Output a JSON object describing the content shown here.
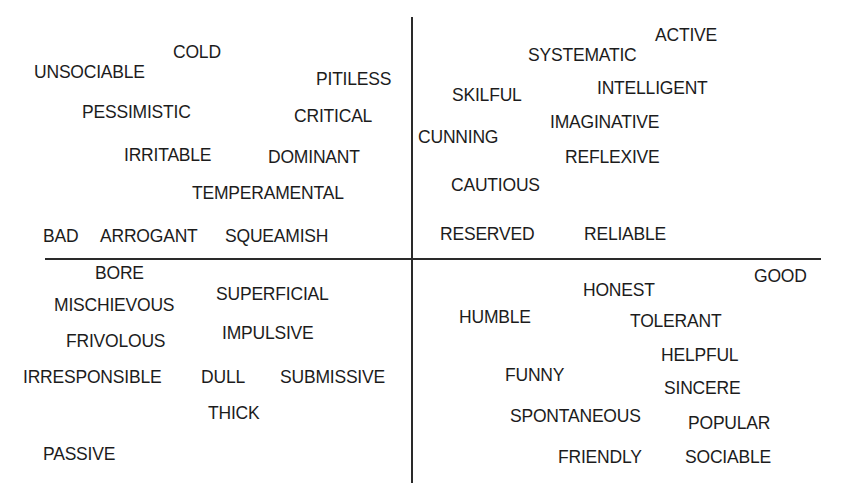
{
  "diagram": {
    "title": "",
    "axes": {
      "vertical_axis_x": 411,
      "horizontal_axis_y": 258
    },
    "quadrants": {
      "top_left": [
        {
          "label": "COLD",
          "x": 173,
          "y": 44
        },
        {
          "label": "UNSOCIABLE",
          "x": 34,
          "y": 64
        },
        {
          "label": "PITILESS",
          "x": 316,
          "y": 71
        },
        {
          "label": "PESSIMISTIC",
          "x": 82,
          "y": 104
        },
        {
          "label": "CRITICAL",
          "x": 294,
          "y": 108
        },
        {
          "label": "IRRITABLE",
          "x": 124,
          "y": 147
        },
        {
          "label": "DOMINANT",
          "x": 268,
          "y": 149
        },
        {
          "label": "TEMPERAMENTAL",
          "x": 192,
          "y": 185
        },
        {
          "label": "BAD",
          "x": 43,
          "y": 228
        },
        {
          "label": "ARROGANT",
          "x": 100,
          "y": 228
        },
        {
          "label": "SQUEAMISH",
          "x": 225,
          "y": 228
        }
      ],
      "top_right": [
        {
          "label": "ACTIVE",
          "x": 655,
          "y": 27
        },
        {
          "label": "SYSTEMATIC",
          "x": 528,
          "y": 47
        },
        {
          "label": "SKILFUL",
          "x": 452,
          "y": 87
        },
        {
          "label": "INTELLIGENT",
          "x": 597,
          "y": 80
        },
        {
          "label": "IMAGINATIVE",
          "x": 550,
          "y": 114
        },
        {
          "label": "CUNNING",
          "x": 418,
          "y": 129
        },
        {
          "label": "REFLEXIVE",
          "x": 565,
          "y": 149
        },
        {
          "label": "CAUTIOUS",
          "x": 451,
          "y": 177
        },
        {
          "label": "RESERVED",
          "x": 440,
          "y": 226
        },
        {
          "label": "RELIABLE",
          "x": 584,
          "y": 226
        }
      ],
      "bottom_left": [
        {
          "label": "BORE",
          "x": 95,
          "y": 265
        },
        {
          "label": "SUPERFICIAL",
          "x": 216,
          "y": 286
        },
        {
          "label": "MISCHIEVOUS",
          "x": 54,
          "y": 297
        },
        {
          "label": "IMPULSIVE",
          "x": 222,
          "y": 325
        },
        {
          "label": "FRIVOLOUS",
          "x": 66,
          "y": 333
        },
        {
          "label": "IRRESPONSIBLE",
          "x": 23,
          "y": 369
        },
        {
          "label": "DULL",
          "x": 201,
          "y": 369
        },
        {
          "label": "SUBMISSIVE",
          "x": 280,
          "y": 369
        },
        {
          "label": "THICK",
          "x": 208,
          "y": 405
        },
        {
          "label": "PASSIVE",
          "x": 43,
          "y": 446
        }
      ],
      "bottom_right": [
        {
          "label": "GOOD",
          "x": 754,
          "y": 268
        },
        {
          "label": "HONEST",
          "x": 583,
          "y": 282
        },
        {
          "label": "HUMBLE",
          "x": 459,
          "y": 309
        },
        {
          "label": "TOLERANT",
          "x": 630,
          "y": 313
        },
        {
          "label": "HELPFUL",
          "x": 661,
          "y": 347
        },
        {
          "label": "FUNNY",
          "x": 505,
          "y": 367
        },
        {
          "label": "SINCERE",
          "x": 664,
          "y": 380
        },
        {
          "label": "SPONTANEOUS",
          "x": 510,
          "y": 408
        },
        {
          "label": "POPULAR",
          "x": 688,
          "y": 415
        },
        {
          "label": "FRIENDLY",
          "x": 558,
          "y": 449
        },
        {
          "label": "SOCIABLE",
          "x": 685,
          "y": 449
        }
      ]
    }
  }
}
